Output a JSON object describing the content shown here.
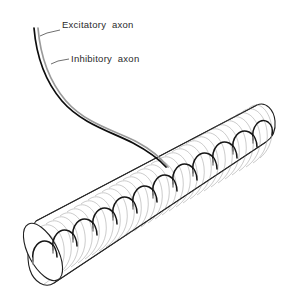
{
  "figure": {
    "background_color": "#ffffff",
    "width": 288,
    "height": 300
  },
  "labels": {
    "excitatory": {
      "text": "Excitatory  axon",
      "x": 62,
      "y": 27,
      "leader": "M 60 29 L 47 33 L 41 35",
      "color": "#2b2b2b"
    },
    "inhibitory": {
      "text": "Inhibitory  axon",
      "x": 70,
      "y": 62,
      "leader": "M 68 59 L 57 61 L 52 63",
      "color": "#2b2b2b"
    }
  },
  "axons": {
    "excitatory": {
      "name": "Excitatory axon",
      "color": "#0d0d0d",
      "stroke_width": 1.7,
      "path": "M 34 28 C 36 52, 44 80, 62 101 C 82 124, 112 132, 133 143 C 148 151, 158 158, 166 167"
    },
    "inhibitory": {
      "name": "Inhibitory axon",
      "color": "#9a9a9a",
      "stroke_width": 1.7,
      "path": "M 38 28 C 40 52, 48 80, 66 101 C 86 124, 116 131, 137 142 C 152 150, 161 158, 168 167"
    }
  },
  "muscle_fiber": {
    "name": "muscle-fiber",
    "outline_color": "#1f1f1f",
    "fill_color": "#ffffff",
    "striation_color": "#a8a8a8",
    "striation_count": 34,
    "body_path": "M 36 222 L 258 106 A 20 30 0 0 1 272 134 L 54 283 A 22 32 0 0 1 30 252 Z",
    "left_cap": {
      "cx": 42,
      "cy": 253,
      "rx": 14,
      "ry": 31,
      "rotation": -29
    },
    "top_edge": "M 36 222 L 258 106",
    "bottom_edge": "M 272 134 L 54 283"
  },
  "nerve_terminals": {
    "name": "nerve-terminal-chain",
    "arc_color": "#151515",
    "stub_color": "#8d8d8d",
    "count": 12,
    "description": "Chain of scalloped synaptic terminal arcs running along the muscle fiber surface"
  },
  "colors": {
    "background": "#ffffff",
    "ink": "#1f1f1f",
    "excitatory": "#0d0d0d",
    "inhibitory": "#9a9a9a",
    "striation": "#a8a8a8",
    "label_text": "#2b2b2b"
  }
}
